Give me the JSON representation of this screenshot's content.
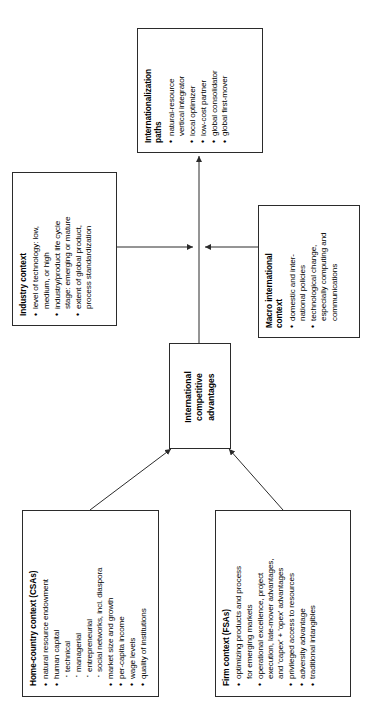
{
  "diagram": {
    "orientation": "rotated-90-ccw",
    "line_color": "#2b2b2b",
    "background": "#ffffff",
    "nodes": {
      "internationalization_paths": {
        "title": "Internationalization\npaths",
        "bullets": [
          "natural-resource\nvertical integrator",
          "local optimizer",
          "low-cost partner",
          "global consolidator",
          "global first-mover"
        ]
      },
      "industry_context": {
        "title": "Industry context",
        "bullets": [
          "level of technology: low,\nmedium, or high",
          "industry/product life cycle\nstage: emerging or mature",
          "extent of global product,\nprocess standardization"
        ]
      },
      "macro_international_context": {
        "title": "Macro international\ncontext",
        "bullets": [
          "domestic and inter-\nnational policies",
          "technological change,\nespecially computing and\ncommunications"
        ]
      },
      "center": {
        "label": "International\ncompetitive\nadvantages"
      },
      "home_country_context": {
        "title": "Home-country context (CSAs)",
        "bullets": [
          "natural resource endowment",
          "human capital",
          "market size and growth",
          "per-capita income",
          "wage levels",
          "quality of institutions"
        ],
        "sub_bullets": [
          "technical",
          "managerial",
          "entrepreneurial",
          "social networks, incl. diaspora"
        ]
      },
      "firm_context": {
        "title": "Firm context (FSAs)",
        "bullets": [
          "optimizing products and process\nfor emerging markets",
          "operational excellence, project\nexecution, late-mover advantages,\nand 'capex' + 'opex' advantages",
          "privileged access to resources",
          "adversity advantage",
          "traditional intangibles"
        ]
      }
    }
  }
}
